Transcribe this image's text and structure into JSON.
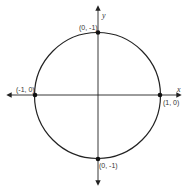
{
  "diagram": {
    "axes": {
      "x_label": "x",
      "y_label": "y"
    },
    "points": [
      {
        "id": "top",
        "label": "(0, -1)",
        "x": 0,
        "y": 1
      },
      {
        "id": "left",
        "label": "(-1, 0)",
        "x": -1,
        "y": 0
      },
      {
        "id": "right",
        "label": "(1, 0)",
        "x": 1,
        "y": 0
      },
      {
        "id": "bottom",
        "label": "(0, -1)",
        "x": 0,
        "y": -1
      }
    ],
    "colors": {
      "line": "#222222",
      "point": "#111111",
      "text": "#333333"
    }
  }
}
